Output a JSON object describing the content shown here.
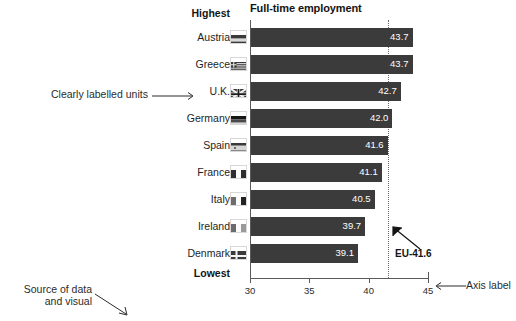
{
  "chart_data": {
    "type": "bar",
    "orientation": "horizontal",
    "title": "Full-time employment",
    "xlabel": "",
    "ylabel": "",
    "xlim": [
      30,
      45
    ],
    "xticks": [
      30,
      35,
      40,
      45
    ],
    "xtick_labels": [
      "30",
      "35",
      "40",
      "45"
    ],
    "grid": false,
    "legend": "none",
    "categories": [
      "Austria",
      "Greece",
      "U.K.",
      "Germany",
      "Spain",
      "France",
      "Italy",
      "Ireland",
      "Denmark"
    ],
    "values": [
      43.7,
      43.7,
      42.7,
      42.0,
      41.6,
      41.1,
      40.5,
      39.7,
      39.1
    ],
    "value_labels": [
      "43.7",
      "43.7",
      "42.7",
      "42.0",
      "41.6",
      "41.1",
      "40.5",
      "39.7",
      "39.1"
    ],
    "reference_line": {
      "label": "EU-41.6",
      "value": 41.6,
      "style": "dotted"
    },
    "rank_labels": {
      "top": "Highest",
      "bottom": "Lowest"
    },
    "bar_color": "#3b3b3b",
    "value_text_color": "#ffffff",
    "axis_color": "#5a5a5a"
  },
  "rows": [
    {
      "country": "Austria",
      "value_label": "43.7",
      "flag": "flag-austria"
    },
    {
      "country": "Greece",
      "value_label": "43.7",
      "flag": "flag-greece"
    },
    {
      "country": "U.K.",
      "value_label": "42.7",
      "flag": "flag-uk"
    },
    {
      "country": "Germany",
      "value_label": "42.0",
      "flag": "flag-germany"
    },
    {
      "country": "Spain",
      "value_label": "41.6",
      "flag": "flag-spain"
    },
    {
      "country": "France",
      "value_label": "41.1",
      "flag": "flag-france"
    },
    {
      "country": "Italy",
      "value_label": "40.5",
      "flag": "flag-italy"
    },
    {
      "country": "Ireland",
      "value_label": "39.7",
      "flag": "flag-ireland"
    },
    {
      "country": "Denmark",
      "value_label": "39.1",
      "flag": "flag-denmark"
    }
  ],
  "annotations": {
    "units": "Clearly labelled units",
    "axis_label": "Axis label",
    "source_line1": "Source of data",
    "source_line2": "and visual"
  },
  "colors": {
    "bar": "#3b3b3b",
    "axis": "#5a5a5a",
    "annotation_text": "#2b2b2b",
    "title_text": "#141414",
    "reference_line": "#6e6e6e"
  }
}
